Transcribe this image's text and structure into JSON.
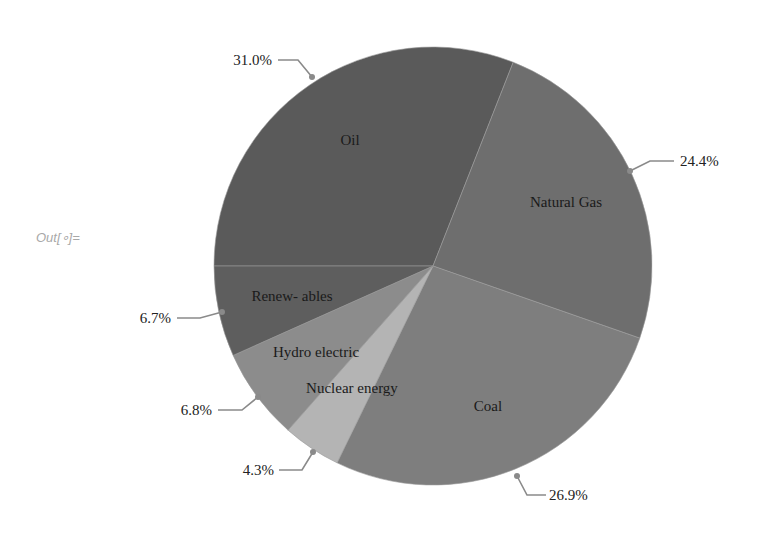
{
  "cell": {
    "out_label": "Out[∘]="
  },
  "chart_data": {
    "type": "pie",
    "title": "",
    "categories": [
      "Oil",
      "Natural Gas",
      "Coal",
      "Nuclear energy",
      "Hydro electric",
      "Renew- ables"
    ],
    "values": [
      31.0,
      24.4,
      26.9,
      4.3,
      6.8,
      6.7
    ],
    "value_labels": [
      "31.0%",
      "24.4%",
      "26.9%",
      "4.3%",
      "6.8%",
      "6.7%"
    ],
    "colors": [
      "#5a5a5a",
      "#6e6e6e",
      "#7e7e7e",
      "#b4b4b4",
      "#8c8c8c",
      "#5e5e5e"
    ],
    "units": "%",
    "legend": "none",
    "labels_inside": true,
    "percent_callouts": true
  },
  "labels": {
    "oil": "Oil",
    "gas": "Natural Gas",
    "coal": "Coal",
    "nuclear": "Nuclear energy",
    "hydro": "Hydro electric",
    "renew": "Renew- ables"
  },
  "pcts": {
    "oil": "31.0%",
    "gas": "24.4%",
    "coal": "26.9%",
    "nuclear": "4.3%",
    "hydro": "6.8%",
    "renew": "6.7%"
  }
}
